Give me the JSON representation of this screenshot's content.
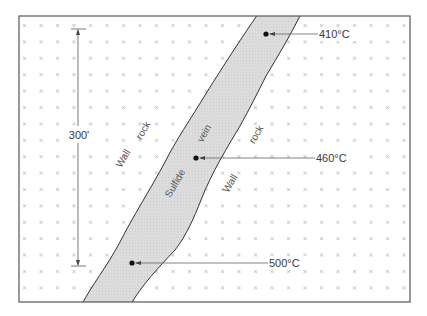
{
  "diagram": {
    "frame": {
      "x": 19,
      "y": 16,
      "w": 391,
      "h": 286
    },
    "colors": {
      "background": "#ffffff",
      "frame": "#555555",
      "vein_fill": "#dcdcdc",
      "vein_outline": "#333333",
      "cross_marks": "#9a9a9a",
      "text": "#3a3a3a"
    },
    "scale_bar": {
      "label": "300'",
      "x": 78,
      "y_top": 30,
      "y_bottom": 265
    },
    "rock_labels": [
      {
        "text": "Wall",
        "x": 126,
        "y": 160,
        "angle": -60
      },
      {
        "text": "rock",
        "x": 146,
        "y": 132,
        "angle": -60
      },
      {
        "text": "rock",
        "x": 259,
        "y": 136,
        "angle": -60
      },
      {
        "text": "Wall",
        "x": 233,
        "y": 185,
        "angle": -60
      }
    ],
    "vein_labels": [
      {
        "text": "Sulfide",
        "x": 178,
        "y": 185,
        "angle": -60
      },
      {
        "text": "vein",
        "x": 207,
        "y": 135,
        "angle": -60
      }
    ],
    "temperature_points": [
      {
        "label": "410°C",
        "dot_x": 266,
        "dot_y": 34,
        "label_x": 345
      },
      {
        "label": "460°C",
        "dot_x": 196,
        "dot_y": 158,
        "label_x": 315
      },
      {
        "label": "500°C",
        "dot_x": 132,
        "dot_y": 263,
        "label_x": 270
      }
    ]
  }
}
